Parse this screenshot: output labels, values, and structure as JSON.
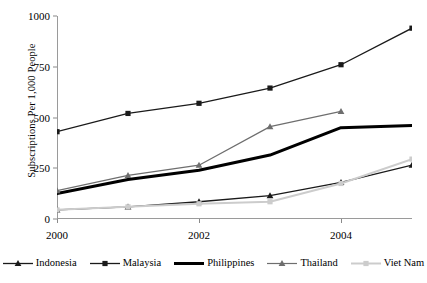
{
  "chart_data": {
    "type": "line",
    "title": "",
    "xlabel": "",
    "ylabel": "Subscriptions Per 1,000 People",
    "x": [
      2000,
      2001,
      2002,
      2003,
      2004,
      2005
    ],
    "xtick_labels": [
      "2000",
      "2002",
      "2004"
    ],
    "xtick_values": [
      2000,
      2002,
      2004
    ],
    "xlim": [
      2000,
      2005
    ],
    "ytick_labels": [
      "0",
      "250",
      "500",
      "750",
      "1000"
    ],
    "ytick_values": [
      0,
      250,
      500,
      750,
      1000
    ],
    "ylim": [
      0,
      1000
    ],
    "grid": false,
    "legend_position": "bottom",
    "series": [
      {
        "name": "Indonesia",
        "marker": "triangle",
        "color": "#1a1a1a",
        "line_width": 1.3,
        "values": [
          45,
          60,
          85,
          115,
          180,
          265
        ]
      },
      {
        "name": "Malaysia",
        "marker": "square",
        "color": "#1a1a1a",
        "line_width": 1.3,
        "values": [
          430,
          520,
          570,
          645,
          760,
          940
        ]
      },
      {
        "name": "Philippines",
        "marker": "none",
        "color": "#000000",
        "line_width": 3.0,
        "values": [
          125,
          195,
          240,
          315,
          450,
          460
        ]
      },
      {
        "name": "Thailand",
        "marker": "triangle",
        "color": "#6e6e6e",
        "line_width": 1.2,
        "values": [
          140,
          215,
          265,
          455,
          530,
          null
        ]
      },
      {
        "name": "Viet Nam",
        "marker": "square",
        "color": "#cccccc",
        "line_width": 2.0,
        "values": [
          45,
          60,
          75,
          85,
          175,
          295
        ]
      }
    ]
  },
  "legend": {
    "items": [
      {
        "label": "Indonesia"
      },
      {
        "label": "Malaysia"
      },
      {
        "label": "Philippines"
      },
      {
        "label": "Thailand"
      },
      {
        "label": "Viet Nam"
      }
    ]
  }
}
